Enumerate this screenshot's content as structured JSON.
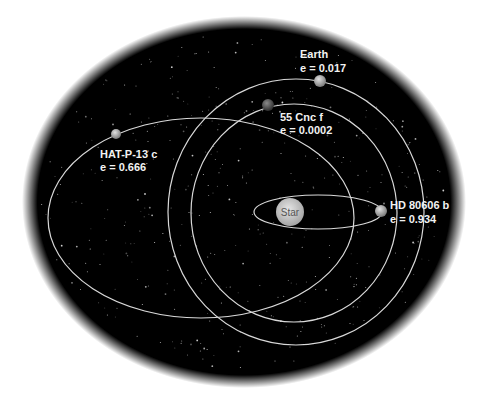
{
  "diagram": {
    "background": {
      "color": "#000000",
      "page_color": "#ffffff",
      "cx": 244,
      "cy": 202,
      "rx": 214,
      "ry": 178
    },
    "orbit_color": "#d9d9d9",
    "star": {
      "label": "Star",
      "cx": 290,
      "cy": 212,
      "r": 14,
      "color": "#cfcfcf"
    },
    "planets": [
      {
        "name": "Earth",
        "eccentricity_text": "e = 0.017",
        "eccentricity": 0.017,
        "orbit": {
          "cx": 296,
          "cy": 212,
          "rx": 128,
          "ry": 133
        },
        "body": {
          "cx": 320,
          "cy": 81,
          "r": 6,
          "color": "#9a9a9a"
        },
        "label_pos": {
          "x": 300,
          "y1": 58,
          "y2": 72
        }
      },
      {
        "name": "55 Cnc f",
        "eccentricity_text": "e = 0.0002",
        "eccentricity": 0.0002,
        "orbit": {
          "cx": 294,
          "cy": 213,
          "rx": 103,
          "ry": 109
        },
        "body": {
          "cx": 268,
          "cy": 105,
          "r": 6,
          "color": "#5a5a5a"
        },
        "label_pos": {
          "x": 280,
          "y1": 121,
          "y2": 134
        }
      },
      {
        "name": "HAT-P-13 c",
        "eccentricity_text": "e = 0.666",
        "eccentricity": 0.666,
        "orbit": {
          "cx": 201,
          "cy": 218,
          "rx": 153,
          "ry": 100
        },
        "body": {
          "cx": 116,
          "cy": 134,
          "r": 5,
          "color": "#b8b8b8"
        },
        "label_pos": {
          "x": 100,
          "y1": 158,
          "y2": 171
        }
      },
      {
        "name": "HD 80606 b",
        "eccentricity_text": "e = 0.934",
        "eccentricity": 0.934,
        "orbit": {
          "cx": 318,
          "cy": 212,
          "rx": 64,
          "ry": 17
        },
        "body": {
          "cx": 381,
          "cy": 211,
          "r": 6,
          "color": "#a8a8a8"
        },
        "label_pos": {
          "x": 390,
          "y1": 209,
          "y2": 223
        }
      }
    ]
  }
}
